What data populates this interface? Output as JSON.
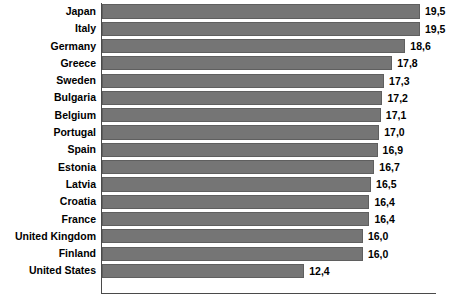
{
  "chart_data": {
    "type": "bar",
    "orientation": "horizontal",
    "title": "",
    "subtitle": "",
    "xlabel": "",
    "ylabel": "",
    "xlim": [
      0,
      19.5
    ],
    "grid": false,
    "legend": null,
    "decimal_separator": ",",
    "bar_color": "#757575",
    "bar_border_color": "#5f5f5f",
    "axis_color": "#4a4a4a",
    "background_color": "#ffffff",
    "text_color": "#000000",
    "categories": [
      "Japan",
      "Italy",
      "Germany",
      "Greece",
      "Sweden",
      "Bulgaria",
      "Belgium",
      "Portugal",
      "Spain",
      "Estonia",
      "Latvia",
      "Croatia",
      "France",
      "United Kingdom",
      "Finland",
      "United States"
    ],
    "values": [
      19.5,
      19.5,
      18.6,
      17.8,
      17.3,
      17.2,
      17.1,
      17.0,
      16.9,
      16.7,
      16.5,
      16.4,
      16.4,
      16.0,
      16.0,
      12.4
    ],
    "value_labels": [
      "19,5",
      "19,5",
      "18,6",
      "17,8",
      "17,3",
      "17,2",
      "17,1",
      "17,0",
      "16,9",
      "16,7",
      "16,5",
      "16,4",
      "16,4",
      "16,0",
      "16,0",
      "12,4"
    ]
  }
}
